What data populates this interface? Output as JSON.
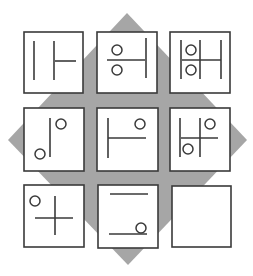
{
  "puzzle": {
    "title": "3x3 figure matrix puzzle",
    "background_shape": "diamond",
    "colors": {
      "diamond": "#a6a6a6",
      "tile_fill": "#ffffff",
      "tile_stroke": "#3a3a3a",
      "line": "#3a3a3a"
    },
    "diamond_points": [
      [
        127,
        13
      ],
      [
        247,
        140
      ],
      [
        128,
        265
      ],
      [
        8,
        140
      ]
    ],
    "tiles": [
      {
        "row": 1,
        "col": 1,
        "box": [
          24,
          32,
          59,
          61
        ],
        "lines": [
          [
            34,
            41,
            34,
            80
          ],
          [
            54,
            41,
            54,
            80
          ],
          [
            55,
            61,
            76,
            61
          ]
        ],
        "circles": []
      },
      {
        "row": 1,
        "col": 2,
        "box": [
          97,
          32,
          60,
          61
        ],
        "lines": [
          [
            107,
            60,
            145,
            60
          ],
          [
            146,
            38,
            146,
            78
          ]
        ],
        "circles": [
          [
            117,
            50,
            5
          ],
          [
            117,
            70,
            5
          ]
        ]
      },
      {
        "row": 1,
        "col": 3,
        "box": [
          170,
          32,
          60,
          61
        ],
        "lines": [
          [
            181,
            40,
            181,
            79
          ],
          [
            200,
            40,
            200,
            79
          ],
          [
            221,
            40,
            221,
            79
          ],
          [
            182,
            60,
            221,
            60
          ]
        ],
        "circles": [
          [
            191,
            50,
            5
          ],
          [
            191,
            70,
            5
          ]
        ]
      },
      {
        "row": 2,
        "col": 1,
        "box": [
          24,
          108,
          60,
          63
        ],
        "lines": [
          [
            50,
            118,
            50,
            157
          ]
        ],
        "circles": [
          [
            61,
            124,
            5
          ],
          [
            40,
            154,
            5
          ]
        ]
      },
      {
        "row": 2,
        "col": 2,
        "box": [
          97,
          108,
          61,
          63
        ],
        "lines": [
          [
            108,
            118,
            108,
            158
          ],
          [
            108,
            138,
            146,
            138
          ]
        ],
        "circles": [
          [
            140,
            124,
            5
          ]
        ]
      },
      {
        "row": 2,
        "col": 3,
        "box": [
          170,
          108,
          60,
          63
        ],
        "lines": [
          [
            180,
            118,
            180,
            157
          ],
          [
            200,
            118,
            200,
            157
          ],
          [
            181,
            138,
            218,
            138
          ]
        ],
        "circles": [
          [
            210,
            124,
            5
          ],
          [
            188,
            149,
            5
          ]
        ]
      },
      {
        "row": 3,
        "col": 1,
        "box": [
          24,
          185,
          60,
          62
        ],
        "lines": [
          [
            55,
            196,
            55,
            235
          ],
          [
            35,
            218,
            73,
            218
          ]
        ],
        "circles": [
          [
            35,
            201,
            5
          ]
        ]
      },
      {
        "row": 3,
        "col": 2,
        "box": [
          98,
          185,
          60,
          63
        ],
        "lines": [
          [
            110,
            194,
            148,
            194
          ],
          [
            109,
            234,
            147,
            234
          ]
        ],
        "circles": [
          [
            141,
            228,
            5
          ]
        ]
      },
      {
        "row": 3,
        "col": 3,
        "box": [
          172,
          186,
          59,
          61
        ],
        "lines": [],
        "circles": [],
        "missing": true
      }
    ]
  }
}
